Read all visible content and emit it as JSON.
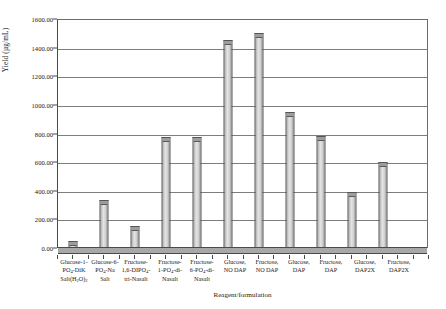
{
  "chart_data": {
    "type": "bar",
    "title": "",
    "xlabel": "Reagent/formulation",
    "ylabel": "Yield (µg/mL)",
    "ylim": [
      0,
      1600
    ],
    "ytick_step": 200,
    "ytick_labels": [
      "0.00",
      "200.00",
      "400.00",
      "600.00",
      "800.00",
      "1000.00",
      "1200.00",
      "1400.00",
      "1600.00"
    ],
    "grid": true,
    "legend": "none",
    "categories": [
      "Glucose-1-PO4-DiK Salt(H2O)2",
      "Glucose-6-PO4-Na Salt",
      "Fructose-1,6-DIPO4-tri-Nasalt",
      "Fructose-1-PO4-di-Nasalt",
      "Fructose-6-PO4-di-Nasalt",
      "Glucose, NO DAP",
      "Fructose, NO DAP",
      "Glucose, DAP",
      "Fructose, DAP",
      "Glucose, DAP2X",
      "Fructose, DAP2X"
    ],
    "category_lines": [
      [
        "Glucose-1-",
        "PO",
        "4",
        "-DiK",
        "Salt(H",
        "2",
        "O)",
        "2"
      ],
      [
        "Glucose-6-",
        "PO",
        "4",
        "-Na",
        "Salt"
      ],
      [
        "Fructose-",
        "1,6-DIPO",
        "4",
        "-",
        "tri-Nasalt"
      ],
      [
        "Fructose-",
        "1-PO",
        "4",
        "-di-",
        "Nasalt"
      ],
      [
        "Fructose-",
        "6-PO",
        "4",
        "-di-",
        "Nasalt"
      ],
      [
        "Glucose,",
        "NO DAP"
      ],
      [
        "Fructose,",
        "NO DAP"
      ],
      [
        "Glucose,",
        "DAP"
      ],
      [
        "Fructose,",
        "DAP"
      ],
      [
        "Glucose,",
        "DAP2X"
      ],
      [
        "Fructose,",
        "DAP2X"
      ]
    ],
    "values": [
      50,
      335,
      155,
      775,
      775,
      1455,
      1505,
      950,
      780,
      390,
      600
    ],
    "n_bars": 12,
    "bar_positions_note": "12 bar slots; bars 4 and 5 share equal height",
    "bar_color": "#d3d3d3",
    "bar_edge_color": "#555555",
    "axis_color": "#4a4a4a",
    "grid_color": "#7d7d7d"
  },
  "labels": {
    "cat1": {
      "l1": "Glucose-1-",
      "l2a": "PO",
      "l2sub": "4",
      "l2b": "-DiK",
      "l3a": "Salt(H",
      "l3sub1": "2",
      "l3b": "O)",
      "l3sub2": "2"
    },
    "cat2": {
      "l1": "Glucose-6-",
      "l2a": "PO",
      "l2sub": "4",
      "l2b": "-Na",
      "l3": "Salt"
    },
    "cat3": {
      "l1": "Fructose-",
      "l2a": "1,6-DIPO",
      "l2sub": "4",
      "l2b": "-",
      "l3": "tri-Nasalt"
    },
    "cat4": {
      "l1": "Fructose-",
      "l2a": "1-PO",
      "l2sub": "4",
      "l2b": "-di-",
      "l3": "Nasalt"
    },
    "cat5": {
      "l1": "Fructose-",
      "l2a": "6-PO",
      "l2sub": "4",
      "l2b": "-di-",
      "l3": "Nasalt"
    },
    "cat6": {
      "l1": "Glucose,",
      "l2": "NO DAP"
    },
    "cat7": {
      "l1": "Fructose,",
      "l2": "NO DAP"
    },
    "cat8": {
      "l1": "Glucose,",
      "l2": "DAP"
    },
    "cat9": {
      "l1": "Fructose,",
      "l2": "DAP"
    },
    "cat10": {
      "l1": "Glucose,",
      "l2": "DAP2X"
    },
    "cat11": {
      "l1": "Fructose,",
      "l2": "DAP2X"
    }
  },
  "yticks": {
    "t0": "0.00",
    "t1": "200.00",
    "t2": "400.00",
    "t3": "600.00",
    "t4": "800.00",
    "t5": "1000.00",
    "t6": "1200.00",
    "t7": "1400.00",
    "t8": "1600.00"
  }
}
